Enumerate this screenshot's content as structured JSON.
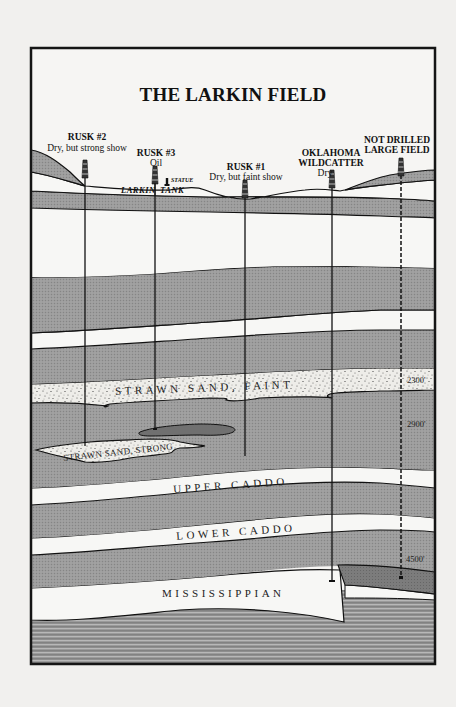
{
  "title": "THE LARKIN FIELD",
  "colors": {
    "background": "#f1f0ee",
    "frame": "#1a1a1a",
    "shale_gray": "#9a9a9a",
    "dark_gray": "#7a7a7a",
    "white_layer": "#f7f7f5",
    "sand": "#ecebe7",
    "oil_pool": "#6f6f6f"
  },
  "wells": [
    {
      "id": "rusk-2",
      "name": "RUSK #2",
      "status": "Dry, but strong show",
      "drilled": true
    },
    {
      "id": "rusk-3",
      "name": "RUSK #3",
      "status": "Oil",
      "drilled": true
    },
    {
      "id": "rusk-1",
      "name": "RUSK #1",
      "status": "Dry, but faint show",
      "drilled": true
    },
    {
      "id": "oklahoma-wildcatter",
      "name_line1": "OKLAHOMA",
      "name_line2": "WILDCATTER",
      "status": "Dry",
      "drilled": true
    },
    {
      "id": "not-drilled",
      "name_line1": "NOT DRILLED",
      "name_line2": "LARGE FIELD",
      "drilled": false
    }
  ],
  "surface": {
    "larkin": "LARKIN",
    "tank": "TANK",
    "statue": "STATUE"
  },
  "layers": {
    "strawn_faint": "STRAWN SAND, FAINT",
    "strawn_strong": "STRAWN SAND, STRONG",
    "upper_caddo": "UPPER CADDO",
    "lower_caddo": "LOWER CADDO",
    "mississippian": "MISSISSIPPIAN"
  },
  "depths": [
    "2300'",
    "2900'",
    "4500'"
  ]
}
